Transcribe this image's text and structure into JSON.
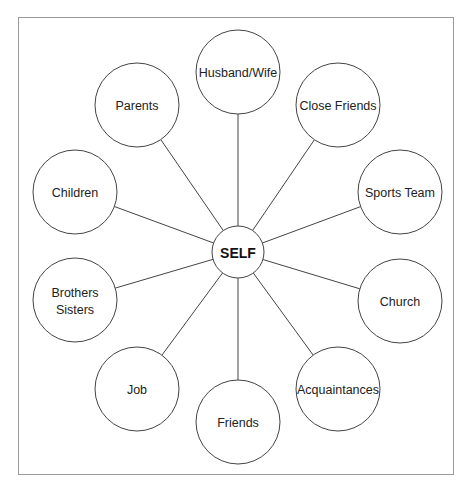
{
  "diagram": {
    "title": "",
    "frame": {
      "x": 18,
      "y": 17,
      "width": 436,
      "height": 458,
      "border_color": "#9a9a9a"
    },
    "stroke_color": "#444444",
    "center": {
      "id": "self",
      "label": "SELF",
      "cx": 238,
      "cy": 252,
      "r": 26
    },
    "node_radius": 42,
    "nodes": [
      {
        "id": "husband-wife",
        "lines": [
          "Husband/Wife"
        ],
        "cx": 238,
        "cy": 72
      },
      {
        "id": "close-friends",
        "lines": [
          "Close Friends"
        ],
        "cx": 338,
        "cy": 105
      },
      {
        "id": "sports-team",
        "lines": [
          "Sports Team"
        ],
        "cx": 400,
        "cy": 192
      },
      {
        "id": "church",
        "lines": [
          "Church"
        ],
        "cx": 400,
        "cy": 301
      },
      {
        "id": "acquaintances",
        "lines": [
          "Acquaintances"
        ],
        "cx": 338,
        "cy": 389
      },
      {
        "id": "friends",
        "lines": [
          "Friends"
        ],
        "cx": 238,
        "cy": 422
      },
      {
        "id": "job",
        "lines": [
          "Job"
        ],
        "cx": 137,
        "cy": 389
      },
      {
        "id": "brothers-sisters",
        "lines": [
          "Brothers",
          "Sisters"
        ],
        "cx": 75,
        "cy": 300
      },
      {
        "id": "children",
        "lines": [
          "Children"
        ],
        "cx": 75,
        "cy": 192
      },
      {
        "id": "parents",
        "lines": [
          "Parents"
        ],
        "cx": 137,
        "cy": 105
      }
    ]
  },
  "caption": {
    "text": "",
    "note": "cropped"
  }
}
